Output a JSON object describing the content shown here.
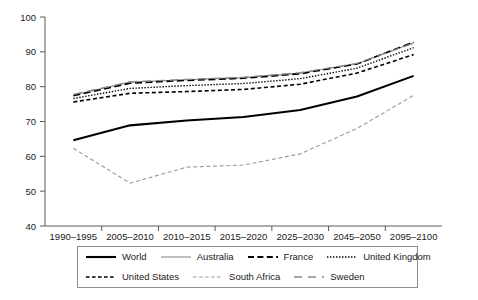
{
  "chart_data": {
    "type": "line",
    "title": "",
    "xlabel": "",
    "ylabel": "",
    "ylim": [
      40,
      100
    ],
    "yticks": [
      40,
      50,
      60,
      70,
      80,
      90,
      100
    ],
    "grid": false,
    "legend_position": "bottom",
    "categories": [
      "1990–1995",
      "2005–2010",
      "2010–2015",
      "2015–2020",
      "2025–2030",
      "2045–2050",
      "2095–2100"
    ],
    "series": [
      {
        "name": "World",
        "style": "solid",
        "color": "#000000",
        "width": 2.1,
        "values": [
          64.6,
          68.9,
          70.3,
          71.3,
          73.3,
          77.2,
          83.1
        ]
      },
      {
        "name": "Australia",
        "style": "solid-thin",
        "color": "#8a8a8a",
        "width": 1.1,
        "values": [
          77.6,
          81.3,
          82.0,
          82.6,
          83.9,
          86.6,
          92.6
        ]
      },
      {
        "name": "France",
        "style": "dashed",
        "color": "#000000",
        "width": 1.6,
        "values": [
          77.4,
          81.0,
          81.8,
          82.4,
          83.7,
          86.5,
          92.8
        ]
      },
      {
        "name": "United Kingdom",
        "style": "dotted",
        "color": "#000000",
        "width": 1.4,
        "values": [
          76.6,
          79.5,
          80.3,
          80.9,
          82.3,
          85.3,
          91.2
        ]
      },
      {
        "name": "United States",
        "style": "dashed-short",
        "color": "#000000",
        "width": 1.6,
        "values": [
          75.6,
          78.1,
          78.6,
          79.2,
          80.7,
          83.9,
          89.2
        ]
      },
      {
        "name": "South Africa",
        "style": "dashed-short",
        "color": "#9a9a9a",
        "width": 1.1,
        "values": [
          62.3,
          52.3,
          56.9,
          57.5,
          60.7,
          68.0,
          77.5
        ]
      },
      {
        "name": "Sweden",
        "style": "dashed-long",
        "color": "#8a8a8a",
        "width": 1.3,
        "values": [
          77.8,
          81.4,
          82.1,
          82.7,
          84.0,
          86.7,
          92.5
        ]
      }
    ]
  },
  "axes": {
    "y_tick_labels": [
      "100",
      "90",
      "80",
      "70",
      "60",
      "50",
      "40"
    ],
    "x_tick_labels": [
      "1990–1995",
      "2005–2010",
      "2010–2015",
      "2015–2020",
      "2025–2030",
      "2045–2050",
      "2095–2100"
    ],
    "axis_color": "#5a5a5a"
  },
  "legend": {
    "row1": [
      {
        "label": "World",
        "style": "solid"
      },
      {
        "label": "Australia",
        "style": "solid-thin"
      },
      {
        "label": "France",
        "style": "dashed"
      },
      {
        "label": "United Kingdom",
        "style": "dotted"
      }
    ],
    "row2": [
      {
        "label": "United States",
        "style": "dashed-short"
      },
      {
        "label": "South Africa",
        "style": "dashed-short-gray"
      },
      {
        "label": "Sweden",
        "style": "dashed-long"
      }
    ]
  }
}
